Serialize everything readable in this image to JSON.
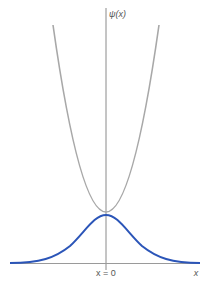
{
  "diagram": {
    "y_axis_label": "ψ(x)",
    "origin_label": "x = 0",
    "x_axis_label": "x",
    "curves": [
      {
        "name": "potential",
        "description": "parabolic potential (gray)",
        "color": "#a8a8a8"
      },
      {
        "name": "wavefunction",
        "description": "Gaussian ground-state wavefunction (blue)",
        "color": "#2b55b8"
      }
    ],
    "axis_color": "#888888"
  }
}
